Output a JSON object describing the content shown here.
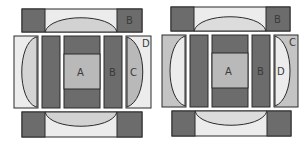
{
  "diagram": {
    "type": "quilt-block-layout",
    "colors": {
      "dark": "#6c6c6c",
      "medium": "#b9b9b9",
      "light": "#dcdcdc",
      "pale": "#ececec",
      "outline": "#2b2b2b"
    },
    "blocks": [
      {
        "id": "left-block",
        "labels": {
          "top_right": "B",
          "center": "A",
          "right_strip": "B",
          "right_inner": "C",
          "right_corner": "D"
        }
      },
      {
        "id": "right-block",
        "labels": {
          "top_right": "B",
          "center": "A",
          "right_strip": "B",
          "right_inner": "D",
          "right_corner": "C"
        }
      }
    ]
  }
}
